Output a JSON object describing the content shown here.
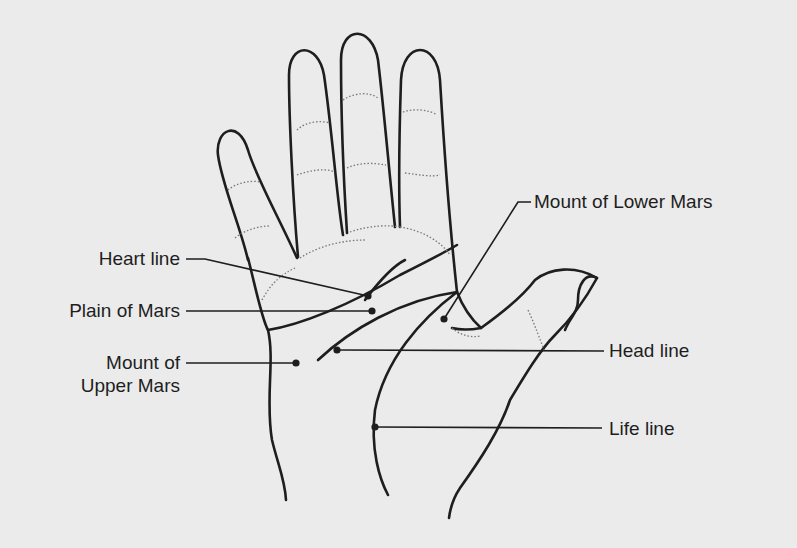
{
  "diagram": {
    "colors": {
      "background": "#ebebeb",
      "ink": "#1e1e1e",
      "dotted": "#777777"
    },
    "labels": [
      {
        "id": "heart-line",
        "text": "Heart line"
      },
      {
        "id": "plain-of-mars",
        "text": "Plain of Mars"
      },
      {
        "id": "mount-upper-mars-1",
        "text": "Mount of"
      },
      {
        "id": "mount-upper-mars-2",
        "text": "Upper Mars"
      },
      {
        "id": "mount-lower-mars",
        "text": "Mount of Lower Mars"
      },
      {
        "id": "head-line",
        "text": "Head line"
      },
      {
        "id": "life-line",
        "text": "Life line"
      }
    ]
  }
}
